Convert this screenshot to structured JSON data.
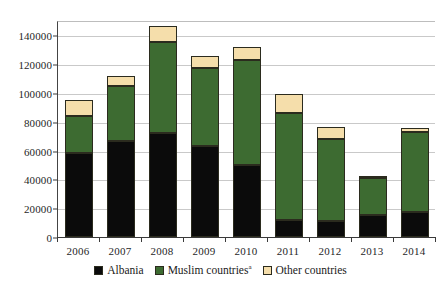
{
  "chart_data": {
    "type": "bar",
    "stacked": true,
    "title": "",
    "xlabel": "",
    "ylabel": "",
    "categories": [
      "2006",
      "2007",
      "2008",
      "2009",
      "2010",
      "2011",
      "2012",
      "2013",
      "2014"
    ],
    "series": [
      {
        "name": "Albania",
        "color": "#0b0b0b",
        "values": [
          58000,
          67000,
          72500,
          63500,
          50000,
          12000,
          11000,
          15500,
          17500
        ]
      },
      {
        "name": "Muslim countries",
        "name_superscript": "a",
        "color": "#3d6b31",
        "values": [
          26000,
          38000,
          63000,
          54000,
          73000,
          74000,
          57000,
          25500,
          55500
        ]
      },
      {
        "name": "Other countries",
        "color": "#f5deab",
        "values": [
          11000,
          7000,
          11000,
          8500,
          9000,
          13000,
          8500,
          500,
          3000
        ]
      }
    ],
    "totals": [
      95000,
      112000,
      146500,
      126000,
      132000,
      99000,
      76500,
      41500,
      76000
    ],
    "ylim": [
      0,
      150000
    ],
    "yticks": [
      0,
      20000,
      40000,
      60000,
      80000,
      100000,
      120000,
      140000
    ],
    "ytick_labels": [
      "0",
      "20000",
      "40000",
      "60000",
      "80000",
      "100000",
      "120000",
      "140000"
    ],
    "grid": true,
    "legend_position": "bottom"
  },
  "legend": {
    "items": [
      {
        "label": "Albania",
        "superscript": "",
        "color": "#0b0b0b"
      },
      {
        "label": "Muslim countries",
        "superscript": "a",
        "color": "#3d6b31"
      },
      {
        "label": "Other countries",
        "superscript": "",
        "color": "#f5deab"
      }
    ]
  },
  "colors": {
    "albania": "#0b0b0b",
    "muslim_countries": "#3d6b31",
    "other_countries": "#f5deab",
    "gridline": "#c9c9c9",
    "axis": "#3a3a3a",
    "background": "#ffffff"
  }
}
